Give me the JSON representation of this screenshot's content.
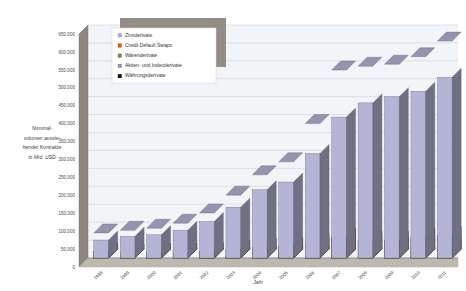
{
  "chart_data": {
    "type": "bar",
    "subtype": "stacked-3d-column",
    "title": "",
    "xlabel": "Jahr",
    "ylabel": "Nominalvolumen ausstehender Kontrakte in Mrd. USD",
    "ylabel_lines": [
      "Nominal-",
      "volumen ausste-",
      "hender Kontrakte",
      "in Mrd. USD"
    ],
    "categories": [
      "1998",
      "1999",
      "2000",
      "2001",
      "2002",
      "2003",
      "2004",
      "2005",
      "2006",
      "2007",
      "2008",
      "2009",
      "2010",
      "2011"
    ],
    "ylim": [
      0,
      650000
    ],
    "ytick_step": 50000,
    "ytick_labels": [
      "0",
      "50.000",
      "100.000",
      "150.000",
      "200.000",
      "250.000",
      "300.000",
      "350.000",
      "400.000",
      "450.000",
      "500.000",
      "550.000",
      "600.000",
      "650.000"
    ],
    "ytick_values": [
      0,
      50000,
      100000,
      150000,
      200000,
      250000,
      300000,
      350000,
      400000,
      450000,
      500000,
      550000,
      600000,
      650000
    ],
    "grid": true,
    "legend_position": "top-left-inside",
    "series": [
      {
        "name": "Währungsderivate",
        "color": "#111111",
        "values": [
          18000,
          14300,
          15700,
          16700,
          18500,
          24500,
          29300,
          31400,
          40200,
          56200,
          50000,
          49200,
          57800,
          63300
        ]
      },
      {
        "name": "Aktien- und Indexderivate",
        "color": "#9a9ac0",
        "values": [
          1500,
          1800,
          1900,
          2000,
          2300,
          3800,
          4400,
          5800,
          7500,
          8500,
          6500,
          5900,
          5600,
          6000
        ]
      },
      {
        "name": "Warenderivate",
        "color": "#8c8060",
        "values": [
          500,
          600,
          700,
          800,
          900,
          1400,
          1400,
          5400,
          7100,
          8500,
          3800,
          2900,
          2900,
          3100
        ]
      },
      {
        "name": "Credit Default Swaps",
        "color": "#e2620c",
        "values": [
          0,
          0,
          0,
          0,
          2200,
          3800,
          6400,
          13900,
          28700,
          58200,
          41900,
          32700,
          29900,
          28600
        ]
      },
      {
        "name": "Zinsderivate",
        "color": "#b4b4d6",
        "values": [
          50000,
          60400,
          64700,
          77500,
          101700,
          141900,
          190500,
          211900,
          291600,
          393100,
          432700,
          449900,
          465300,
          504100
        ]
      }
    ],
    "totals": [
      70000,
      77100,
      83000,
      97000,
      125600,
      175400,
      232000,
      268400,
      375100,
      524500,
      534900,
      540600,
      561500,
      605100
    ]
  },
  "legend": {
    "items": [
      {
        "label": "Zinsderivate",
        "color": "#b4b4d6"
      },
      {
        "label": "Credit Default Swaps",
        "color": "#e2620c"
      },
      {
        "label": "Warenderivate",
        "color": "#8c8060"
      },
      {
        "label": "Aktien- und Indexderivate",
        "color": "#9a9ac0"
      },
      {
        "label": "Währungsderivate",
        "color": "#111111"
      }
    ]
  },
  "colors": {
    "plot_background": "#f1f5f8",
    "gridline": "#c9d4dc",
    "wall": "#8d877f",
    "wall_light": "#a39c93",
    "floor": "#bdb8b0",
    "legend_shadow": "#8d877f",
    "legend_background": "#ffffff"
  }
}
